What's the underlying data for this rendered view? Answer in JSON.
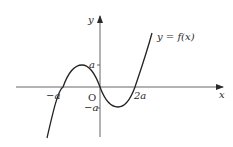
{
  "diagram": {
    "type": "function-graph",
    "colors": {
      "ink": "#2a2a2a",
      "axis": "#555555",
      "background": "#ffffff"
    },
    "axes": {
      "x_label": "x",
      "y_label": "y",
      "origin_label": "O"
    },
    "curve_label": "y = f(x)",
    "x_ticks": [
      {
        "label": "−a"
      },
      {
        "label": "2a"
      }
    ],
    "y_ticks": [
      {
        "label": "a"
      },
      {
        "label": "−a"
      }
    ]
  }
}
